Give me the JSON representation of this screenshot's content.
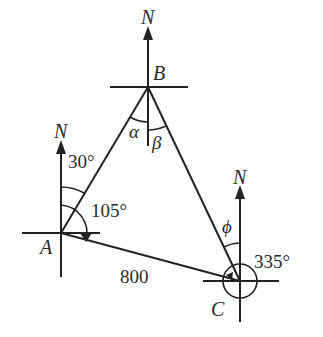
{
  "diagram": {
    "type": "bearing-triangle",
    "points": {
      "A": {
        "label": "A",
        "north_label": "N"
      },
      "B": {
        "label": "B",
        "north_label": "N"
      },
      "C": {
        "label": "C",
        "north_label": "N"
      }
    },
    "angles": {
      "A_to_B": "30°",
      "A_to_C": "105°",
      "C_to_B": "335°",
      "alpha": "α",
      "beta": "β",
      "phi": "ϕ"
    },
    "sides": {
      "AC": "800"
    }
  }
}
